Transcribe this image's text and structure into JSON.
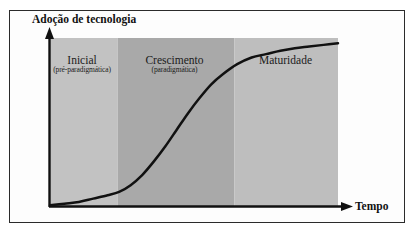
{
  "figure": {
    "border_color": "#2b2b2b",
    "background": "#ffffff"
  },
  "chart_data": {
    "type": "line",
    "title": "",
    "xlabel": "Tempo",
    "ylabel": "Adoção de tecnologia",
    "grid": false,
    "legend": "none",
    "axes": {
      "x_arrow": true,
      "y_arrow": true,
      "x_ticks": [],
      "y_ticks": [],
      "xlim": [
        0,
        1
      ],
      "ylim": [
        0,
        1
      ]
    },
    "series": [
      {
        "name": "Curva de adoção (S-curve)",
        "color": "#111111",
        "x": [
          0.0,
          0.05,
          0.1,
          0.15,
          0.2,
          0.24,
          0.28,
          0.32,
          0.36,
          0.4,
          0.44,
          0.48,
          0.52,
          0.56,
          0.6,
          0.65,
          0.7,
          0.75,
          0.8,
          0.85,
          0.9,
          0.95,
          1.0
        ],
        "y": [
          0.01,
          0.02,
          0.03,
          0.05,
          0.07,
          0.09,
          0.13,
          0.19,
          0.27,
          0.36,
          0.46,
          0.56,
          0.65,
          0.73,
          0.79,
          0.85,
          0.89,
          0.91,
          0.93,
          0.945,
          0.955,
          0.965,
          0.975
        ]
      }
    ],
    "zones": [
      {
        "id": "inicial",
        "title": "Inicial",
        "subtitle": "(pré-paradigmática)",
        "color": "#c2c2c2",
        "x_start": 0.0,
        "x_end": 0.235
      },
      {
        "id": "crescimento",
        "title": "Crescimento",
        "subtitle": "(paradigmática)",
        "color": "#a9a9a9",
        "x_start": 0.235,
        "x_end": 0.64
      },
      {
        "id": "maturidade",
        "title": "Maturidade",
        "subtitle": "",
        "color": "#bebebe",
        "x_start": 0.64,
        "x_end": 1.0
      }
    ]
  }
}
